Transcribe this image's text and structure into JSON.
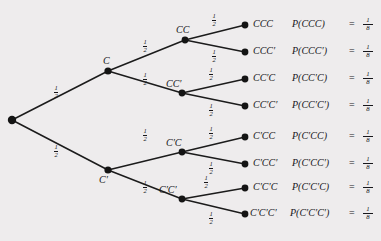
{
  "diagram": {
    "type": "probability-tree",
    "background_color": "#eeeced",
    "ink_color": "#17161a",
    "levels": 3,
    "outcome_count": 8
  },
  "nodes": {
    "root": {
      "label": ""
    },
    "level1": [
      {
        "id": "C",
        "label": "C"
      },
      {
        "id": "Cp",
        "label": "C′"
      }
    ],
    "level2": [
      {
        "id": "CC",
        "label": "CC"
      },
      {
        "id": "CCp",
        "label": "CC′"
      },
      {
        "id": "CpC",
        "label": "C′C"
      },
      {
        "id": "CpCp",
        "label": "C′C′"
      }
    ]
  },
  "edge_probability": {
    "numerator": "1",
    "denominator": "2"
  },
  "equals_sign": "=",
  "outcomes": [
    {
      "label": "CCC",
      "prob_expr": "P(CCC)",
      "numerator": "1",
      "denominator": "8"
    },
    {
      "label": "CCC′",
      "prob_expr": "P(CCC′)",
      "numerator": "1",
      "denominator": "8"
    },
    {
      "label": "CC′C",
      "prob_expr": "P(CC′C)",
      "numerator": "1",
      "denominator": "8"
    },
    {
      "label": "CC′C′",
      "prob_expr": "P(CC′C′)",
      "numerator": "1",
      "denominator": "8"
    },
    {
      "label": "C′CC",
      "prob_expr": "P(C′CC)",
      "numerator": "1",
      "denominator": "8"
    },
    {
      "label": "C′CC′",
      "prob_expr": "P(C′CC′)",
      "numerator": "1",
      "denominator": "8"
    },
    {
      "label": "C′C′C",
      "prob_expr": "P(C′C′C)",
      "numerator": "1",
      "denominator": "8"
    },
    {
      "label": "C′C′C′",
      "prob_expr": "P(C′C′C′)",
      "numerator": "1",
      "denominator": "8"
    }
  ]
}
